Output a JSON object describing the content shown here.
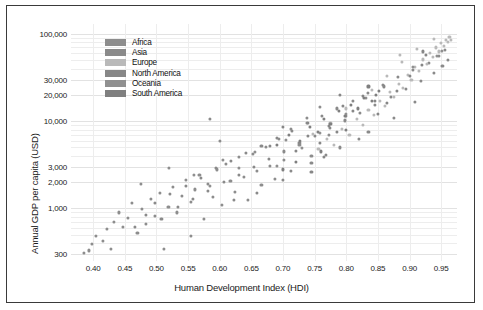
{
  "chart_data": {
    "type": "scatter",
    "title": "",
    "xlabel": "Human Development Index (HDI)",
    "ylabel": "Annual GDP per capita (USD)",
    "xlim": [
      0.365,
      0.975
    ],
    "ylim": [
      250,
      130000
    ],
    "yscale": "log",
    "xscale": "linear",
    "grid": true,
    "xticks": [
      0.4,
      0.45,
      0.5,
      0.55,
      0.6,
      0.65,
      0.7,
      0.75,
      0.8,
      0.85,
      0.9,
      0.95
    ],
    "xticklabels": [
      "0.40",
      "0.45",
      "0.50",
      "0.55",
      "0.60",
      "0.65",
      "0.70",
      "0.75",
      "0.80",
      "0.85",
      "0.90",
      "0.95"
    ],
    "yticks": [
      300,
      1000,
      2000,
      3000,
      10000,
      20000,
      30000,
      100000
    ],
    "yticklabels": [
      "300",
      "1,000",
      "2,000",
      "3,000",
      "10,000",
      "20,000",
      "30,000",
      "100,000"
    ],
    "gridlines_y": [
      300,
      400,
      500,
      600,
      700,
      800,
      900,
      1000,
      2000,
      3000,
      4000,
      5000,
      6000,
      7000,
      8000,
      9000,
      10000,
      20000,
      30000,
      40000,
      50000,
      60000,
      70000,
      80000,
      90000,
      100000
    ],
    "point_color": "#8a8a8a",
    "marker_size": 3.1,
    "legend": {
      "position": "top-left-inside",
      "entries": [
        {
          "label": "Africa",
          "color": "#8d8d8d"
        },
        {
          "label": "Asia",
          "color": "#8a8a8a"
        },
        {
          "label": "Europe",
          "color": "#b9b9b9"
        },
        {
          "label": "North America",
          "color": "#878787"
        },
        {
          "label": "Oceania",
          "color": "#909090"
        },
        {
          "label": "South America",
          "color": "#7f7f7f"
        }
      ]
    },
    "series": [
      {
        "name": "Africa",
        "color": "#8d8d8d",
        "points": [
          [
            0.394,
            330
          ],
          [
            0.385,
            310
          ],
          [
            0.404,
            480
          ],
          [
            0.398,
            390
          ],
          [
            0.422,
            580
          ],
          [
            0.415,
            420
          ],
          [
            0.433,
            700
          ],
          [
            0.428,
            340
          ],
          [
            0.441,
            900
          ],
          [
            0.447,
            620
          ],
          [
            0.455,
            780
          ],
          [
            0.462,
            1150
          ],
          [
            0.47,
            520
          ],
          [
            0.477,
            980
          ],
          [
            0.484,
            660
          ],
          [
            0.491,
            1300
          ],
          [
            0.498,
            820
          ],
          [
            0.505,
            1500
          ],
          [
            0.512,
            340
          ],
          [
            0.519,
            1050
          ],
          [
            0.526,
            1750
          ],
          [
            0.533,
            900
          ],
          [
            0.54,
            1400
          ],
          [
            0.547,
            2100
          ],
          [
            0.554,
            1200
          ],
          [
            0.561,
            1650
          ],
          [
            0.568,
            2400
          ],
          [
            0.575,
            760
          ],
          [
            0.582,
            1900
          ],
          [
            0.589,
            1350
          ],
          [
            0.596,
            2800
          ],
          [
            0.603,
            1100
          ],
          [
            0.61,
            3200
          ],
          [
            0.617,
            2050
          ],
          [
            0.624,
            1550
          ],
          [
            0.631,
            3900
          ],
          [
            0.638,
            2300
          ],
          [
            0.645,
            1250
          ],
          [
            0.652,
            4200
          ],
          [
            0.659,
            2700
          ],
          [
            0.666,
            1850
          ],
          [
            0.673,
            5100
          ],
          [
            0.68,
            3100
          ],
          [
            0.687,
            2200
          ],
          [
            0.694,
            6300
          ],
          [
            0.701,
            3600
          ],
          [
            0.712,
            8200
          ],
          [
            0.726,
            5400
          ],
          [
            0.738,
            11000
          ],
          [
            0.745,
            4000
          ],
          [
            0.759,
            14500
          ],
          [
            0.772,
            7000
          ],
          [
            0.52,
            2900
          ],
          [
            0.555,
            480
          ],
          [
            0.6,
            6000
          ],
          [
            0.475,
            1900
          ]
        ]
      },
      {
        "name": "Asia",
        "color": "#8a8a8a",
        "points": [
          [
            0.466,
            610
          ],
          [
            0.483,
            850
          ],
          [
            0.497,
            1150
          ],
          [
            0.508,
            760
          ],
          [
            0.521,
            1450
          ],
          [
            0.534,
            1050
          ],
          [
            0.546,
            1800
          ],
          [
            0.558,
            1300
          ],
          [
            0.57,
            2250
          ],
          [
            0.582,
            1600
          ],
          [
            0.594,
            2900
          ],
          [
            0.606,
            2000
          ],
          [
            0.618,
            3500
          ],
          [
            0.63,
            2450
          ],
          [
            0.642,
            4300
          ],
          [
            0.654,
            3000
          ],
          [
            0.666,
            5200
          ],
          [
            0.678,
            3700
          ],
          [
            0.69,
            6400
          ],
          [
            0.702,
            4500
          ],
          [
            0.714,
            7800
          ],
          [
            0.726,
            5600
          ],
          [
            0.738,
            9500
          ],
          [
            0.75,
            6800
          ],
          [
            0.762,
            11500
          ],
          [
            0.774,
            8400
          ],
          [
            0.786,
            14000
          ],
          [
            0.798,
            10200
          ],
          [
            0.81,
            17000
          ],
          [
            0.822,
            12500
          ],
          [
            0.834,
            21000
          ],
          [
            0.846,
            15500
          ],
          [
            0.858,
            26000
          ],
          [
            0.87,
            19000
          ],
          [
            0.882,
            32000
          ],
          [
            0.894,
            23500
          ],
          [
            0.906,
            39000
          ],
          [
            0.918,
            29000
          ],
          [
            0.93,
            47000
          ],
          [
            0.938,
            35500
          ],
          [
            0.946,
            56000
          ],
          [
            0.952,
            43000
          ],
          [
            0.956,
            66000
          ],
          [
            0.96,
            50000
          ],
          [
            0.585,
            10500
          ],
          [
            0.622,
            1250
          ],
          [
            0.7,
            2100
          ],
          [
            0.745,
            3300
          ],
          [
            0.79,
            5000
          ],
          [
            0.835,
            7500
          ],
          [
            0.875,
            11000
          ],
          [
            0.908,
            16500
          ],
          [
            0.659,
            1500
          ],
          [
            0.712,
            2700
          ],
          [
            0.768,
            4100
          ],
          [
            0.82,
            6200
          ]
        ]
      },
      {
        "name": "Europe",
        "color": "#b9b9b9",
        "points": [
          [
            0.756,
            4800
          ],
          [
            0.769,
            6200
          ],
          [
            0.781,
            5400
          ],
          [
            0.793,
            8100
          ],
          [
            0.805,
            7000
          ],
          [
            0.817,
            10500
          ],
          [
            0.826,
            9000
          ],
          [
            0.835,
            13500
          ],
          [
            0.844,
            11800
          ],
          [
            0.853,
            17000
          ],
          [
            0.861,
            15000
          ],
          [
            0.869,
            21500
          ],
          [
            0.876,
            19000
          ],
          [
            0.883,
            27000
          ],
          [
            0.89,
            24000
          ],
          [
            0.897,
            34000
          ],
          [
            0.903,
            30000
          ],
          [
            0.909,
            42000
          ],
          [
            0.915,
            37500
          ],
          [
            0.921,
            51000
          ],
          [
            0.927,
            45000
          ],
          [
            0.932,
            60000
          ],
          [
            0.937,
            54000
          ],
          [
            0.942,
            70000
          ],
          [
            0.946,
            63000
          ],
          [
            0.95,
            78000
          ],
          [
            0.954,
            72000
          ],
          [
            0.957,
            86000
          ],
          [
            0.96,
            80000
          ],
          [
            0.963,
            92000
          ],
          [
            0.966,
            85000
          ],
          [
            0.938,
            88000
          ],
          [
            0.912,
            67000
          ],
          [
            0.888,
            48000
          ],
          [
            0.864,
            33000
          ],
          [
            0.84,
            23000
          ],
          [
            0.8,
            14000
          ],
          [
            0.775,
            9500
          ],
          [
            0.748,
            7200
          ],
          [
            0.885,
            58000
          ]
        ]
      },
      {
        "name": "North America",
        "color": "#878787",
        "points": [
          [
            0.72,
            4600
          ],
          [
            0.74,
            6800
          ],
          [
            0.758,
            5700
          ],
          [
            0.772,
            8800
          ],
          [
            0.786,
            7600
          ],
          [
            0.8,
            11500
          ],
          [
            0.74,
            9500
          ],
          [
            0.765,
            3900
          ],
          [
            0.795,
            15000
          ],
          [
            0.81,
            13000
          ],
          [
            0.826,
            19500
          ],
          [
            0.845,
            17000
          ],
          [
            0.86,
            25000
          ],
          [
            0.88,
            22000
          ],
          [
            0.9,
            33000
          ],
          [
            0.92,
            44000
          ],
          [
            0.926,
            58000
          ],
          [
            0.85,
            12000
          ],
          [
            0.7,
            8500
          ],
          [
            0.68,
            5200
          ],
          [
            0.745,
            2600
          ],
          [
            0.79,
            20000
          ],
          [
            0.921,
            63000
          ],
          [
            0.865,
            16000
          ]
        ]
      },
      {
        "name": "Oceania",
        "color": "#909090",
        "points": [
          [
            0.56,
            2400
          ],
          [
            0.605,
            3600
          ],
          [
            0.63,
            2900
          ],
          [
            0.655,
            4400
          ],
          [
            0.705,
            6100
          ],
          [
            0.73,
            4900
          ],
          [
            0.758,
            7400
          ],
          [
            0.8,
            12000
          ],
          [
            0.831,
            18500
          ],
          [
            0.906,
            42000
          ],
          [
            0.944,
            56000
          ],
          [
            0.951,
            64000
          ],
          [
            0.69,
            3100
          ],
          [
            0.585,
            1800
          ]
        ]
      },
      {
        "name": "South America",
        "color": "#7f7f7f",
        "points": [
          [
            0.69,
            5400
          ],
          [
            0.71,
            6900
          ],
          [
            0.727,
            6000
          ],
          [
            0.742,
            8600
          ],
          [
            0.755,
            7600
          ],
          [
            0.765,
            10500
          ],
          [
            0.775,
            9200
          ],
          [
            0.788,
            13000
          ],
          [
            0.798,
            11500
          ],
          [
            0.808,
            15500
          ],
          [
            0.818,
            14000
          ],
          [
            0.828,
            18500
          ],
          [
            0.84,
            17000
          ],
          [
            0.852,
            22000
          ],
          [
            0.847,
            20000
          ],
          [
            0.76,
            4500
          ],
          [
            0.72,
            3400
          ],
          [
            0.7,
            2800
          ],
          [
            0.835,
            25000
          ],
          [
            0.8,
            8000
          ]
        ]
      }
    ]
  }
}
